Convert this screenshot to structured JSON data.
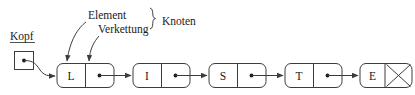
{
  "diagram": {
    "language": "de",
    "head": {
      "label": "Kopf",
      "pointer_glyph": "dot"
    },
    "annotations": [
      {
        "label": "Element",
        "target": "node-data-cell"
      },
      {
        "label": "Verkettung",
        "target": "node-pointer-cell"
      },
      {
        "label": "Knoten",
        "target": "node",
        "brace": "{"
      }
    ],
    "nodes": [
      {
        "value": "L",
        "pointer": "dot",
        "terminator": false
      },
      {
        "value": "I",
        "pointer": "dot",
        "terminator": false
      },
      {
        "value": "S",
        "pointer": "dot",
        "terminator": false
      },
      {
        "value": "T",
        "pointer": "dot",
        "terminator": false
      },
      {
        "value": "E",
        "pointer": "null",
        "terminator": true
      }
    ],
    "colors": {
      "stroke": "#3c3c3c",
      "text": "#1a1a1a",
      "background": "#ffffff"
    }
  }
}
